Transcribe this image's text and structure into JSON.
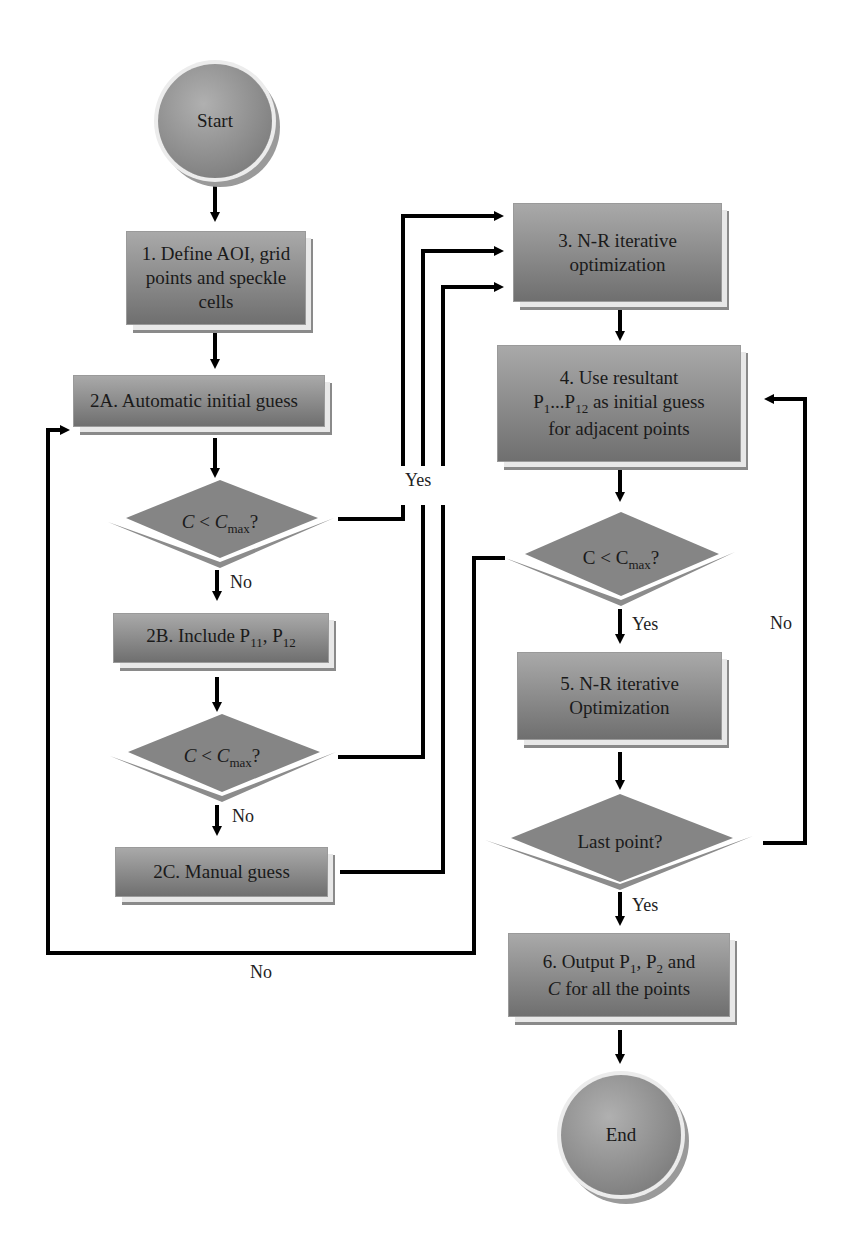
{
  "diagram": {
    "type": "flowchart",
    "nodes": {
      "start": {
        "label": "Start",
        "shape": "circle"
      },
      "step1": {
        "line1": "1. Define AOI, grid",
        "line2": "points and speckle cells",
        "shape": "rectangle"
      },
      "step2a": {
        "label": "2A. Automatic initial guess",
        "shape": "rectangle"
      },
      "decision1": {
        "c": "C",
        "lt": " < ",
        "cmax": "C",
        "sub": "max",
        "q": "?",
        "shape": "diamond"
      },
      "step2b": {
        "prefix": "2B.  Include P",
        "sub1": "11",
        "mid": ", P",
        "sub2": "12",
        "shape": "rectangle"
      },
      "decision2": {
        "c": "C",
        "lt": " < ",
        "cmax": "C",
        "sub": "max",
        "q": "?",
        "shape": "diamond"
      },
      "step2c": {
        "label": "2C. Manual guess",
        "shape": "rectangle"
      },
      "step3": {
        "line1": "3. N-R iterative",
        "line2": "optimization",
        "shape": "rectangle"
      },
      "step4": {
        "line1": "4. Use resultant",
        "l2a": "P",
        "l2s1": "1",
        "l2b": "...P",
        "l2s2": "12",
        "l2c": " as initial guess",
        "line3": "for adjacent points",
        "shape": "rectangle"
      },
      "decision3": {
        "c": "C",
        "lt": " < ",
        "cmax": "C",
        "sub": "max",
        "q": "?",
        "shape": "diamond"
      },
      "step5": {
        "line1": "5. N-R iterative",
        "line2": "Optimization",
        "shape": "rectangle"
      },
      "decision4": {
        "label": "Last point?",
        "shape": "diamond"
      },
      "step6": {
        "l1a": "6. Output P",
        "l1s1": "1",
        "l1b": ", P",
        "l1s2": "2",
        "l1c": " and",
        "l2a": "C",
        "l2b": " for all the points",
        "shape": "rectangle"
      },
      "end": {
        "label": "End",
        "shape": "circle"
      }
    },
    "edge_labels": {
      "yes_to_step3": "Yes",
      "no_d1": "No",
      "no_d2": "No",
      "yes_d3": "Yes",
      "no_d3_loop": "No",
      "no_d4_loop": "No",
      "yes_d4": "Yes"
    },
    "edges": [
      {
        "from": "start",
        "to": "step1"
      },
      {
        "from": "step1",
        "to": "step2a"
      },
      {
        "from": "step2a",
        "to": "decision1"
      },
      {
        "from": "decision1",
        "to": "step3",
        "label": "Yes"
      },
      {
        "from": "decision1",
        "to": "step2b",
        "label": "No"
      },
      {
        "from": "step2b",
        "to": "decision2"
      },
      {
        "from": "decision2",
        "to": "step3",
        "label": "Yes"
      },
      {
        "from": "decision2",
        "to": "step2c",
        "label": "No"
      },
      {
        "from": "step2c",
        "to": "step3"
      },
      {
        "from": "step3",
        "to": "step4"
      },
      {
        "from": "step4",
        "to": "decision3"
      },
      {
        "from": "decision3",
        "to": "step5",
        "label": "Yes"
      },
      {
        "from": "decision3",
        "to": "step2a",
        "label": "No"
      },
      {
        "from": "step5",
        "to": "decision4"
      },
      {
        "from": "decision4",
        "to": "step4",
        "label": "No"
      },
      {
        "from": "decision4",
        "to": "step6",
        "label": "Yes"
      },
      {
        "from": "step6",
        "to": "end"
      }
    ],
    "colors": {
      "node_fill": "#8f8f8f",
      "node_shadow": "#8a8a8a",
      "line": "#000000",
      "text": "#1a1a1a"
    }
  }
}
